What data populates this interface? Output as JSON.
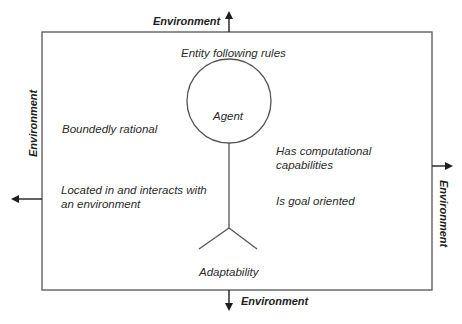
{
  "diagram": {
    "environment_labels": {
      "top": "Environment",
      "bottom": "Environment",
      "left": "Environment",
      "right": "Environment"
    },
    "agent": {
      "label": "Agent",
      "above_label": "Entity following rules",
      "below_label": "Adaptability"
    },
    "properties": {
      "left": [
        "Boundedly rational",
        "Located in and interacts with",
        "an environment"
      ],
      "right": [
        "Has computational",
        "capabilities",
        "Is goal oriented"
      ]
    },
    "colors": {
      "line": "#555555",
      "text": "#2b2b2b",
      "background": "#ffffff"
    }
  }
}
